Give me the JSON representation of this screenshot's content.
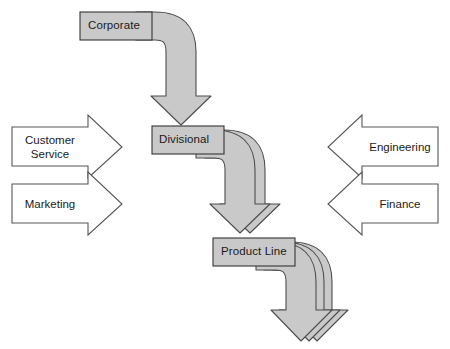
{
  "diagram": {
    "type": "organizational-flow-diagram",
    "background_color": "#ffffff",
    "flow_arrow_fill": "#c9c9c9",
    "flow_arrow_stroke": "#4d4d4d",
    "box_fill": "#c9c9c9",
    "box_stroke": "#333333",
    "side_arrow_fill": "#ffffff",
    "side_arrow_stroke": "#555555",
    "text_color": "#1a1a1a",
    "nodes": [
      {
        "id": "corporate",
        "label": "Corporate",
        "level": 1
      },
      {
        "id": "divisional",
        "label": "Divisional",
        "level": 2
      },
      {
        "id": "product-line",
        "label": "Product Line",
        "level": 3
      }
    ],
    "left_inputs": [
      {
        "id": "customer-service",
        "label": "Customer\nService",
        "direction": "right"
      },
      {
        "id": "marketing",
        "label": "Marketing",
        "direction": "right"
      }
    ],
    "right_inputs": [
      {
        "id": "engineering",
        "label": "Engineering",
        "direction": "left"
      },
      {
        "id": "finance",
        "label": "Finance",
        "direction": "left"
      }
    ],
    "flows": [
      {
        "from": "corporate",
        "to": "divisional",
        "strands": 1
      },
      {
        "from": "divisional",
        "to": "product-line",
        "strands": 2
      },
      {
        "from": "product-line",
        "to": "output",
        "strands": 3
      }
    ]
  }
}
